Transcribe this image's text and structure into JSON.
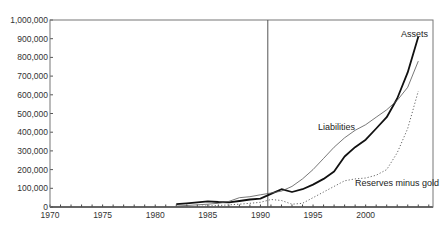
{
  "chart_data": {
    "type": "line",
    "title": "",
    "xlabel": "",
    "ylabel": "",
    "xlim": [
      1970,
      2006.4
    ],
    "ylim": [
      0,
      1000000
    ],
    "grid": false,
    "legend": "inline labels",
    "x_ticks": [
      1970,
      1975,
      1980,
      1985,
      1990,
      1995,
      2000
    ],
    "x_tick_labels": [
      "1970",
      "1975",
      "1980",
      "1985",
      "1990",
      "1995",
      "2000"
    ],
    "y_ticks": [
      0,
      100000,
      200000,
      300000,
      400000,
      500000,
      600000,
      700000,
      800000,
      900000,
      1000000
    ],
    "y_tick_labels": [
      "0",
      "100,000",
      "200,000",
      "300,000",
      "400,000",
      "500,000",
      "600,000",
      "700,000",
      "800,000",
      "900,000",
      "1,000,000"
    ],
    "vertical_marker_x": 1990.7,
    "series": [
      {
        "name": "Assets",
        "style": "thick-solid",
        "color": "#111111",
        "x": [
          1982,
          1983,
          1984,
          1985,
          1986,
          1987,
          1988,
          1989,
          1990,
          1991,
          1992,
          1993,
          1994,
          1995,
          1996,
          1997,
          1998,
          1999,
          2000,
          2001,
          2002,
          2003,
          2004,
          2005
        ],
        "values": [
          15000,
          20000,
          25000,
          30000,
          27000,
          25000,
          32000,
          40000,
          45000,
          70000,
          95000,
          80000,
          95000,
          120000,
          150000,
          190000,
          270000,
          320000,
          360000,
          420000,
          480000,
          580000,
          720000,
          910000
        ],
        "label": "Assets"
      },
      {
        "name": "Liabilities",
        "style": "thin-solid",
        "color": "#555555",
        "x": [
          1982,
          1983,
          1984,
          1985,
          1986,
          1987,
          1988,
          1989,
          1990,
          1991,
          1992,
          1993,
          1994,
          1995,
          1996,
          1997,
          1998,
          1999,
          2000,
          2001,
          2002,
          2003,
          2004,
          2005
        ],
        "values": [
          5000,
          8000,
          12000,
          15000,
          20000,
          30000,
          50000,
          55000,
          65000,
          75000,
          85000,
          110000,
          150000,
          200000,
          260000,
          320000,
          370000,
          410000,
          440000,
          480000,
          520000,
          570000,
          640000,
          780000
        ],
        "label": "Liabilities"
      },
      {
        "name": "Reserves minus gold",
        "style": "dotted",
        "color": "#666666",
        "x": [
          1982,
          1984,
          1986,
          1988,
          1989,
          1990,
          1991,
          1992,
          1993,
          1994,
          1995,
          1996,
          1997,
          1998,
          1999,
          2000,
          2001,
          2002,
          2003,
          2004,
          2005
        ],
        "values": [
          0,
          3000,
          8000,
          15000,
          20000,
          25000,
          40000,
          35000,
          15000,
          20000,
          50000,
          80000,
          110000,
          140000,
          150000,
          155000,
          170000,
          200000,
          290000,
          420000,
          620000
        ],
        "label": "Reserves minus gold"
      }
    ]
  }
}
